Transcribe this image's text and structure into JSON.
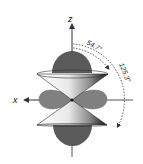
{
  "diagram": {
    "axes": {
      "z_label": "z",
      "x_label": "x"
    },
    "angles": [
      {
        "label": "54.7°"
      },
      {
        "label": "125.3°"
      }
    ],
    "colors": {
      "axial_lobe": "#5a5a5a",
      "torus_lobe": "#808080",
      "cone_light": "#ffffff",
      "cone_dark": "#1a1a1a",
      "axis": "#333333"
    }
  }
}
